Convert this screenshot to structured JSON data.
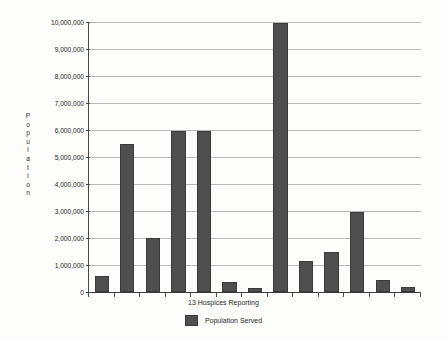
{
  "chart_data": {
    "type": "bar",
    "title": "",
    "xlabel": "13 Hospices Reporting",
    "ylabel": "Population",
    "categories": [
      "1",
      "2",
      "3",
      "4",
      "5",
      "6",
      "7",
      "8",
      "9",
      "10",
      "11",
      "12",
      "13"
    ],
    "values": [
      590000,
      5480000,
      1990000,
      5980000,
      5970000,
      370000,
      160000,
      9950000,
      1150000,
      1470000,
      2950000,
      430000,
      170000
    ],
    "series": [
      {
        "name": "Population Served",
        "values": [
          590000,
          5480000,
          1990000,
          5980000,
          5970000,
          370000,
          160000,
          9950000,
          1150000,
          1470000,
          2950000,
          430000,
          170000
        ]
      }
    ],
    "ylim": [
      0,
      10000000
    ],
    "ytick_values": [
      0,
      1000000,
      2000000,
      3000000,
      4000000,
      5000000,
      6000000,
      7000000,
      8000000,
      9000000,
      10000000
    ],
    "ytick_labels": [
      "0",
      "1,000,000",
      "2,000,000",
      "3,000,000",
      "4,000,000",
      "5,000,000",
      "6,000,000",
      "7,000,000",
      "8,000,000",
      "9,000,000",
      "10,000,000"
    ],
    "xtick_labels": [
      "",
      "",
      "",
      "",
      "",
      "",
      "",
      "",
      "",
      "",
      "",
      "",
      ""
    ],
    "grid": true,
    "legend_position": "bottom",
    "bar_color": "#4f4f4f",
    "grid_color": "#b9b9b9",
    "axis_color": "#4a4a4a",
    "background_color": "#fdfdfc"
  },
  "axes": {
    "y_title_letters": [
      "P",
      "o",
      "p",
      "u",
      "l",
      "a",
      "t",
      "i",
      "o",
      "n"
    ],
    "y_title_text": "Population",
    "x_title_text": "13 Hospices Reporting"
  },
  "legend": {
    "entries": [
      {
        "label": "Population Served",
        "color": "#4f4f4f",
        "swatch": "filled-square-icon"
      }
    ]
  }
}
